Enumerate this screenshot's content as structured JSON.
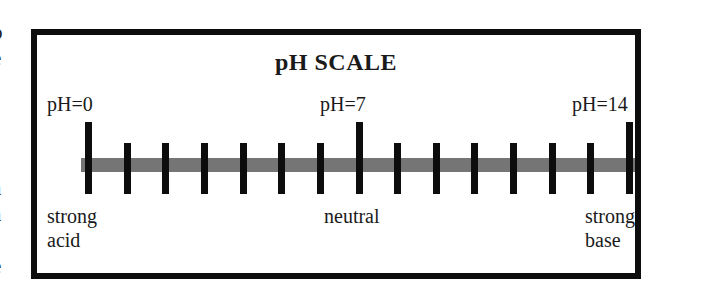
{
  "left_margin_text": [
    "o",
    "e",
    "s",
    "-",
    "-",
    "s",
    "a",
    "a",
    "-",
    "e"
  ],
  "title": "pH SCALE",
  "markers": [
    {
      "ph": 0,
      "label": "pH=0",
      "description": "strong\nacid"
    },
    {
      "ph": 7,
      "label": "pH=7",
      "description": "neutral"
    },
    {
      "ph": 14,
      "label": "pH=14",
      "description": "strong\nbase"
    }
  ],
  "labels": {
    "ph0": "pH=0",
    "ph7": "pH=7",
    "ph14": "pH=14",
    "strong_acid_line1": "strong",
    "strong_acid_line2": "acid",
    "neutral": "neutral",
    "strong_base_line1": "strong",
    "strong_base_line2": "base"
  },
  "scale": {
    "min": 0,
    "max": 14,
    "tick_count": 15,
    "major_ticks": [
      0,
      7,
      14
    ]
  },
  "colors": {
    "frame": "#0d0d0d",
    "bar": "#757575",
    "ticks": "#0d0d0d",
    "background": "#ffffff"
  }
}
